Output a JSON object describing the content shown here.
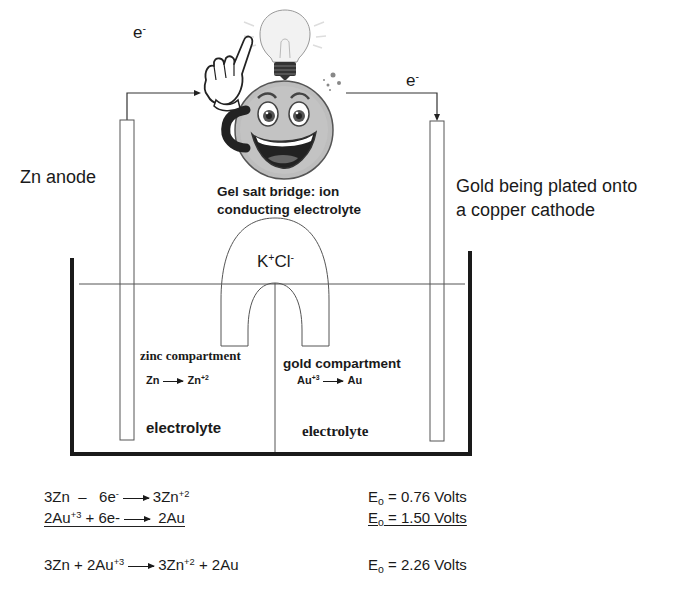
{
  "diagram": {
    "title_labels": {
      "electron_left": {
        "base": "e",
        "sup": "-"
      },
      "electron_right": {
        "base": "e",
        "sup": "-"
      },
      "anode": "Zn anode",
      "cathode_line1": "Gold being plated onto",
      "cathode_line2": "a copper cathode",
      "salt_bridge_line1": "Gel salt bridge: ion",
      "salt_bridge_line2": "conducting electrolyte",
      "salt": {
        "k": "K",
        "k_sup": "+",
        "cl": "Cl",
        "cl_sup": "-"
      }
    },
    "compartments": {
      "zinc": {
        "title": "zinc compartment",
        "reaction": {
          "left": "Zn",
          "right": "Zn",
          "right_sup": "+2"
        },
        "electrolyte": "electrolyte"
      },
      "gold": {
        "title": "gold compartment",
        "reaction": {
          "left": "Au",
          "left_sup": "+3",
          "right": "Au"
        },
        "electrolyte": "electrolyte"
      }
    },
    "equations": [
      {
        "parts": [
          "3Zn",
          "–",
          "6e",
          "-",
          "3Zn",
          "+2"
        ],
        "eo_label": "E",
        "eo_sub": "o",
        "eo_value": "= 0.76 Volts",
        "underlined": false
      },
      {
        "parts": [
          "2Au",
          "+3",
          "+ 6e-",
          "2Au"
        ],
        "eo_label": "E",
        "eo_sub": "o",
        "eo_value": "= 1.50 Volts",
        "underlined": true
      },
      {
        "parts": [
          "3Zn + 2Au",
          "+3",
          "3Zn",
          "+2",
          "+ 2Au"
        ],
        "eo_label": "E",
        "eo_sub": "o",
        "eo_value": "= 2.26 Volts",
        "underlined": false
      }
    ],
    "icons": [
      "light-bulb-icon",
      "smiley-face-icon",
      "pointing-hand-icon",
      "sparkle-dots-icon"
    ]
  }
}
